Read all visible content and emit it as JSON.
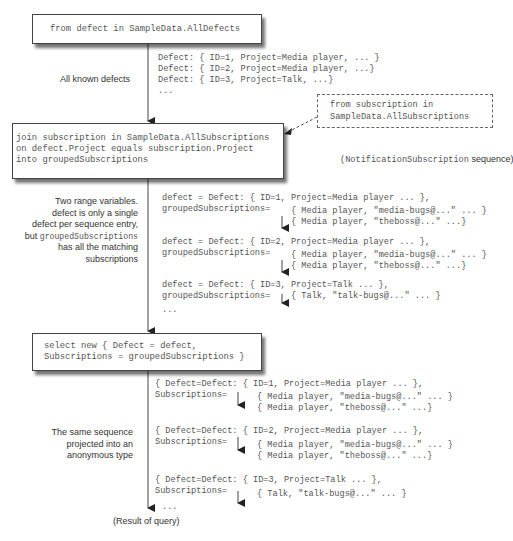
{
  "diagram": {
    "steps": [
      {
        "id": "from",
        "code": [
          "from defect in SampleData.AllDefects"
        ]
      },
      {
        "id": "join",
        "code": [
          "join subscription in SampleData.AllSubscriptions",
          "on defect.Project equals subscription.Project",
          "into groupedSubscriptions"
        ]
      },
      {
        "id": "select",
        "code": [
          "select new { Defect = defect,",
          "Subscriptions = groupedSubscriptions }"
        ]
      }
    ],
    "side_source": {
      "code": [
        "from subscription in",
        "SampleData.AllSubscriptions"
      ],
      "caption_code": "(NotificationSubscription",
      "caption_text": " sequence)"
    },
    "annotations": {
      "all_defects": "All known defects",
      "range_vars": {
        "line1": "Two range variables.",
        "line2": "defect is only a single",
        "line3": "defect per sequence entry,",
        "line4_prefix": "but ",
        "line4_code": "groupedSubscriptions",
        "line5": "has all the matching",
        "line6": "subscriptions"
      },
      "projected": [
        "The same sequence",
        "projected into an",
        "anonymous type"
      ],
      "result": "(Result of query)"
    },
    "sequence1": [
      "Defect: { ID=1, Project=Media player, ... }",
      "Defect: { ID=2, Project=Media player, ...}",
      "Defect: { ID=3, Project=Talk, ...}",
      "..."
    ],
    "sequence2": [
      {
        "defect": "defect = Defect: { ID=1, Project=Media player ... },",
        "label": "groupedSubscriptions=",
        "subs": [
          "{ Media player, \"media-bugs@...\" ... }",
          "{ Media player, \"theboss@...\" ...}"
        ]
      },
      {
        "defect": "defect = Defect: { ID=2, Project=Media player ... },",
        "label": "groupedSubscriptions=",
        "subs": [
          "{ Media player, \"media-bugs@...\" ... }",
          "{ Media player, \"theboss@...\" ...}"
        ]
      },
      {
        "defect": "defect = Defect: { ID=3, Project=Talk ... },",
        "label": "groupedSubscriptions=",
        "subs": [
          "{ Talk, \"talk-bugs@...\" ... }"
        ]
      }
    ],
    "sequence2_ellipsis": "...",
    "sequence3": [
      {
        "defect": "{ Defect=Defect: { ID=1, Project=Media player ... },",
        "label": "Subscriptions=",
        "subs": [
          "{ Media player, \"media-bugs@...\" ... }",
          "{ Media player, \"theboss@...\" ...}"
        ]
      },
      {
        "defect": "{ Defect=Defect: { ID=2, Project=Media player ... },",
        "label": "Subscriptions=",
        "subs": [
          "{ Media player, \"media-bugs@...\" ... }",
          "{ Media player, \"theboss@...\" ...}"
        ]
      },
      {
        "defect": "{ Defect=Defect: { ID=3, Project=Talk ... },",
        "label": "Subscriptions=",
        "subs": [
          "{ Talk, \"talk-bugs@...\" ... }"
        ]
      }
    ],
    "sequence3_ellipsis": "...",
    "colors": {
      "line": "#444444",
      "text": "#555555",
      "shadow": "#222222"
    }
  }
}
